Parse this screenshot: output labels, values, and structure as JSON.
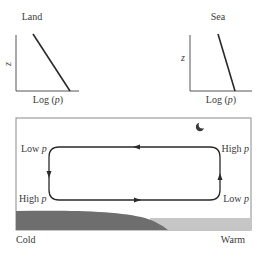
{
  "panels": {
    "land": {
      "title": "Land",
      "y_label": "z",
      "x_label_prefix": "Log (",
      "x_label_var": "p",
      "x_label_suffix": ")"
    },
    "sea": {
      "title": "Sea",
      "y_label": "z",
      "x_label_prefix": "Log (",
      "x_label_var": "p",
      "x_label_suffix": ")"
    }
  },
  "circulation": {
    "top_left": {
      "text": "Low ",
      "var": "p"
    },
    "top_right": {
      "text": "High ",
      "var": "p"
    },
    "bottom_left": {
      "text": "High ",
      "var": "p"
    },
    "bottom_right": {
      "text": "Low ",
      "var": "p"
    },
    "icon": "moon-icon",
    "colors": {
      "land": "#6e6e6e",
      "sea": "#c6c6c6",
      "line": "#2a2a2a",
      "frame": "#8a8a8a"
    }
  },
  "bottom_labels": {
    "left": "Cold",
    "right": "Warm"
  }
}
